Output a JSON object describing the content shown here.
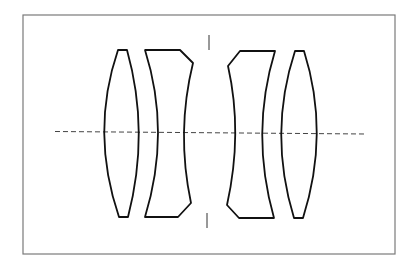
{
  "diagram": {
    "type": "optical-lens-cross-section",
    "colors": {
      "background": "#ffffff",
      "frame": "#7a7a7a",
      "lens_outline": "#111111",
      "axis": "#444444",
      "stop": "#333333"
    },
    "elements": [
      {
        "id": "lens-1",
        "kind": "biconvex"
      },
      {
        "id": "lens-2",
        "kind": "negative-meniscus-chamfered"
      },
      {
        "id": "lens-3",
        "kind": "negative-meniscus-chamfered"
      },
      {
        "id": "lens-4",
        "kind": "biconvex"
      }
    ],
    "aperture_stop": {
      "kind": "vertical-tick-marks",
      "count": 2
    },
    "optical_axis": {
      "style": "dashed"
    }
  }
}
